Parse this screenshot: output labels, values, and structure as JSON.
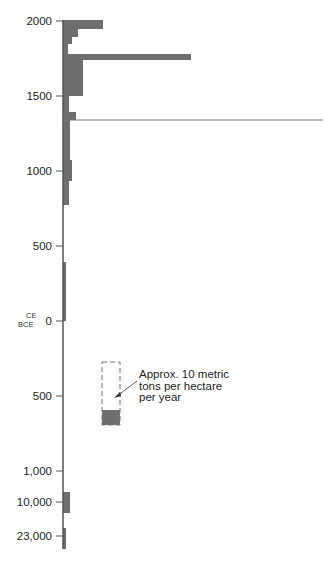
{
  "chart_data": {
    "type": "bar",
    "orientation": "horizontal",
    "title": "",
    "xlabel": "",
    "ylabel": "Year",
    "grid": false,
    "legend": null,
    "era_labels": [
      "CE",
      "BCE"
    ],
    "y_ticks": [
      {
        "label": "2000",
        "y": 21
      },
      {
        "label": "1500",
        "y": 96
      },
      {
        "label": "1000",
        "y": 171
      },
      {
        "label": "500",
        "y": 246
      },
      {
        "label": "0",
        "y": 321
      },
      {
        "label": "500",
        "y": 396
      },
      {
        "label": "1,000",
        "y": 471
      },
      {
        "label": "10,000",
        "y": 502
      },
      {
        "label": "23,000",
        "y": 536
      }
    ],
    "bars": [
      {
        "period": "1950–2000 CE",
        "y0": 20,
        "y1": 29,
        "width": 40
      },
      {
        "period": "1925–1950 CE",
        "y0": 29,
        "y1": 37,
        "width": 15
      },
      {
        "period": "1900–1925 CE",
        "y0": 37,
        "y1": 44,
        "width": 9
      },
      {
        "period": "1870–1900 CE",
        "y0": 44,
        "y1": 54,
        "width": 5
      },
      {
        "period": "~1750 CE (peak)",
        "y0": 54,
        "y1": 60,
        "width": 128
      },
      {
        "period": "1500–1750 CE",
        "y0": 60,
        "y1": 96,
        "width": 20
      },
      {
        "period": "1380–1500 CE",
        "y0": 96,
        "y1": 112,
        "width": 6
      },
      {
        "period": "~1350 CE",
        "y0": 112,
        "y1": 120,
        "width": 13
      },
      {
        "period": "1000–1350 CE",
        "y0": 120,
        "y1": 160,
        "width": 7
      },
      {
        "period": "~1000 CE",
        "y0": 160,
        "y1": 181,
        "width": 9
      },
      {
        "period": "800–1000 CE",
        "y0": 181,
        "y1": 205,
        "width": 6
      },
      {
        "period": "0–400 CE",
        "y0": 262,
        "y1": 321,
        "width": 3
      }
    ],
    "reference_line": {
      "y": 120,
      "x_end": 323
    },
    "bce_bars": [
      {
        "period": "~10,000 BCE",
        "y0": 492,
        "y1": 513,
        "width": 7
      },
      {
        "period": "~23,000 BCE",
        "y0": 528,
        "y1": 549,
        "width": 3
      }
    ],
    "annotation": {
      "text": "Approx. 10 metric\ntons per hectare\nper year",
      "box": {
        "x": 102,
        "y": 362,
        "w": 18,
        "h": 63,
        "filled_from": 410
      }
    }
  },
  "annotation_text": "Approx. 10 metric\ntons per hectare\nper year",
  "colors": {
    "bar": "#6e6e6e",
    "axis": "#555555",
    "line": "#777777",
    "dash": "#777777"
  }
}
